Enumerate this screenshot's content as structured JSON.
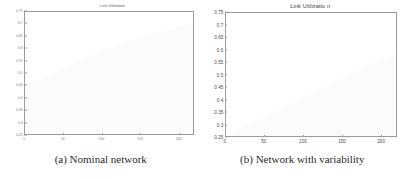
{
  "figure": {
    "subfigures": [
      {
        "caption": "(a) Nominal network",
        "chart": {
          "title": "Link Utilization"
        }
      },
      {
        "caption": "(b) Network with variability",
        "chart": {
          "title": "Link Utilizatio n"
        }
      }
    ]
  },
  "chart_data": [
    {
      "type": "bar",
      "title": "Link Utilization",
      "xlabel": "",
      "ylabel": "",
      "xlim": [
        0,
        220
      ],
      "ylim": [
        0.25,
        0.75
      ],
      "grid": false,
      "legend": null,
      "ytick_labels": [
        "0.75",
        "0.7",
        "0.65",
        "0.6",
        "0.55",
        "0.5",
        "0.45",
        "0.4",
        "0.35",
        "0.3",
        "0.25"
      ],
      "ytick_values": [
        0.75,
        0.7,
        0.65,
        0.6,
        0.55,
        0.5,
        0.45,
        0.4,
        0.35,
        0.3,
        0.25
      ],
      "xtick_labels": [
        "0",
        "50",
        "100",
        "150",
        "200"
      ],
      "xtick_values": [
        0,
        50,
        100,
        150,
        200
      ],
      "bar_color": "#e8e8e8",
      "values": [
        0.451,
        0.452,
        0.453,
        0.455,
        0.456,
        0.458,
        0.459,
        0.461,
        0.462,
        0.464,
        0.466,
        0.467,
        0.469,
        0.471,
        0.472,
        0.474,
        0.476,
        0.478,
        0.479,
        0.481,
        0.483,
        0.485,
        0.487,
        0.489,
        0.491,
        0.492,
        0.494,
        0.496,
        0.498,
        0.5,
        0.502,
        0.504,
        0.506,
        0.508,
        0.51,
        0.512,
        0.514,
        0.516,
        0.518,
        0.52,
        0.522,
        0.524,
        0.526,
        0.528,
        0.53,
        0.532,
        0.534,
        0.536,
        0.538,
        0.54,
        0.542,
        0.544,
        0.546,
        0.548,
        0.55,
        0.552,
        0.554,
        0.556,
        0.557,
        0.559,
        0.561,
        0.563,
        0.565,
        0.567,
        0.569,
        0.57,
        0.572,
        0.574,
        0.576,
        0.578,
        0.579,
        0.581,
        0.583,
        0.585,
        0.586,
        0.588,
        0.59,
        0.591,
        0.593,
        0.595,
        0.596,
        0.598,
        0.6,
        0.601,
        0.603,
        0.604,
        0.606,
        0.608,
        0.609,
        0.611,
        0.612,
        0.614,
        0.615,
        0.617,
        0.618,
        0.62,
        0.621,
        0.623,
        0.624,
        0.626,
        0.627,
        0.628,
        0.63,
        0.631,
        0.633,
        0.634,
        0.635,
        0.637,
        0.638,
        0.639,
        0.641,
        0.642,
        0.643,
        0.645,
        0.646,
        0.647,
        0.648,
        0.65,
        0.651,
        0.652,
        0.653,
        0.655,
        0.656,
        0.657,
        0.658,
        0.659,
        0.661,
        0.662,
        0.663,
        0.664,
        0.665,
        0.666,
        0.667,
        0.669,
        0.67,
        0.671,
        0.672,
        0.673,
        0.674,
        0.675,
        0.676,
        0.677,
        0.678,
        0.679,
        0.68,
        0.681,
        0.682,
        0.683,
        0.684,
        0.685,
        0.686,
        0.687,
        0.688,
        0.689,
        0.69,
        0.691,
        0.692,
        0.693,
        0.694,
        0.695,
        0.696,
        0.697,
        0.698,
        0.698,
        0.699,
        0.7,
        0.701,
        0.702,
        0.703,
        0.704,
        0.704,
        0.705,
        0.706,
        0.707,
        0.708,
        0.708,
        0.709,
        0.71,
        0.711,
        0.711,
        0.712,
        0.713,
        0.714,
        0.714,
        0.715,
        0.716,
        0.716,
        0.717,
        0.718,
        0.718,
        0.719,
        0.72,
        0.72,
        0.721,
        0.722,
        0.722,
        0.723,
        0.723,
        0.724,
        0.725,
        0.725,
        0.726,
        0.726,
        0.727,
        0.727,
        0.728,
        0.728,
        0.729,
        0.729,
        0.73,
        0.73,
        0.731,
        0.731,
        0.732,
        0.732,
        0.733,
        0.733,
        0.734,
        0.734,
        0.735
      ]
    },
    {
      "type": "bar",
      "title": "Link Utilizatio n",
      "xlabel": "",
      "ylabel": "",
      "xlim": [
        0,
        220
      ],
      "ylim": [
        0.25,
        0.75
      ],
      "grid": false,
      "legend": null,
      "ytick_labels": [
        "0.75",
        "0.7",
        "0.65",
        "0.6",
        "0.55",
        "0.5",
        "0.45",
        "0.4",
        "0.35",
        "0.3",
        "0.25"
      ],
      "ytick_values": [
        0.75,
        0.7,
        0.65,
        0.6,
        0.55,
        0.5,
        0.45,
        0.4,
        0.35,
        0.3,
        0.25
      ],
      "xtick_labels": [
        "0",
        "50",
        "100",
        "150",
        "200"
      ],
      "xtick_values": [
        0,
        50,
        100,
        150,
        200
      ],
      "bar_color": "#e2e2e2",
      "values": [
        0.252,
        0.254,
        0.256,
        0.258,
        0.26,
        0.262,
        0.264,
        0.266,
        0.268,
        0.27,
        0.272,
        0.274,
        0.276,
        0.278,
        0.28,
        0.283,
        0.285,
        0.287,
        0.289,
        0.291,
        0.293,
        0.295,
        0.297,
        0.299,
        0.301,
        0.303,
        0.305,
        0.307,
        0.309,
        0.311,
        0.313,
        0.315,
        0.317,
        0.319,
        0.321,
        0.323,
        0.325,
        0.327,
        0.329,
        0.331,
        0.333,
        0.335,
        0.337,
        0.339,
        0.341,
        0.343,
        0.345,
        0.347,
        0.349,
        0.351,
        0.353,
        0.355,
        0.357,
        0.359,
        0.361,
        0.363,
        0.365,
        0.367,
        0.369,
        0.371,
        0.373,
        0.375,
        0.377,
        0.379,
        0.381,
        0.383,
        0.385,
        0.387,
        0.389,
        0.391,
        0.393,
        0.395,
        0.397,
        0.399,
        0.401,
        0.403,
        0.405,
        0.407,
        0.409,
        0.411,
        0.413,
        0.415,
        0.417,
        0.419,
        0.421,
        0.423,
        0.425,
        0.427,
        0.429,
        0.431,
        0.433,
        0.435,
        0.437,
        0.439,
        0.441,
        0.443,
        0.445,
        0.447,
        0.449,
        0.451,
        0.453,
        0.455,
        0.457,
        0.459,
        0.461,
        0.463,
        0.465,
        0.467,
        0.469,
        0.471,
        0.473,
        0.475,
        0.477,
        0.479,
        0.481,
        0.483,
        0.485,
        0.487,
        0.489,
        0.491,
        0.493,
        0.495,
        0.497,
        0.499,
        0.501,
        0.503,
        0.505,
        0.507,
        0.509,
        0.511,
        0.513,
        0.515,
        0.517,
        0.519,
        0.521,
        0.523,
        0.525,
        0.527,
        0.529,
        0.531,
        0.533,
        0.535,
        0.537,
        0.539,
        0.541,
        0.543,
        0.545,
        0.547,
        0.549,
        0.551,
        0.553,
        0.555,
        0.557,
        0.559,
        0.561,
        0.563,
        0.565,
        0.567,
        0.569,
        0.571,
        0.573,
        0.575,
        0.577,
        0.579,
        0.581,
        0.583,
        0.585,
        0.587,
        0.589,
        0.591,
        0.593,
        0.595,
        0.597,
        0.599,
        0.601,
        0.603,
        0.605,
        0.607,
        0.609,
        0.611,
        0.613,
        0.615,
        0.617,
        0.619,
        0.621,
        0.623,
        0.625,
        0.627,
        0.629,
        0.631,
        0.634,
        0.636,
        0.638,
        0.64,
        0.642,
        0.644,
        0.646,
        0.648,
        0.65,
        0.652,
        0.654,
        0.657,
        0.659,
        0.661,
        0.663,
        0.665,
        0.667,
        0.669,
        0.671,
        0.673,
        0.676,
        0.678,
        0.68,
        0.682,
        0.684,
        0.686,
        0.688,
        0.69,
        0.693,
        0.697
      ]
    }
  ]
}
